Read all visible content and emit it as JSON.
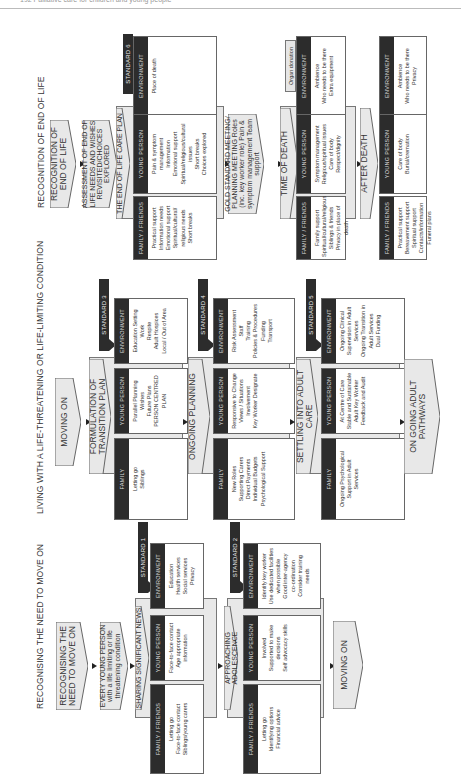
{
  "page": {
    "header_text": "192   Palliative care for children and young people"
  },
  "sections": [
    {
      "title": "RECOGNISING THE NEED TO MOVE ON",
      "intro": [
        {
          "label": "RECOGNISING THE NEED TO MOVE ON"
        },
        {
          "label": "EVERY YOUNG PERSON with a life limiting or life threatening condition"
        }
      ],
      "stages": [
        {
          "label": "SHARING SIGNIFICANT NEWS",
          "standard": "STANDARD 1",
          "family": {
            "heading": "FAMILY / FRIENDS",
            "items": [
              "Letting go",
              "Face-to-face contact",
              "Siblings/young carers"
            ]
          },
          "young_person": {
            "heading": "YOUNG PERSON",
            "items": [
              "Face-to-face contact",
              "Age appropriate",
              "information"
            ]
          },
          "environment": {
            "heading": "ENVIRONMENT",
            "items": [
              "Education",
              "Health services",
              "Social services",
              "Privacy"
            ]
          }
        },
        {
          "label": "APPROACHING ADOLESCENCE",
          "standard": "STANDARD 2",
          "family": {
            "heading": "FAMILY / FRIENDS",
            "items": [
              "Letting go",
              "Identifying options",
              "Financial advice"
            ]
          },
          "young_person": {
            "heading": "YOUNG PERSON",
            "items": [
              "Involved",
              "Supported to make",
              "decisions",
              "Self advocacy skills"
            ]
          },
          "environment": {
            "heading": "ENVIRONMENT",
            "items": [
              "Identify key worker",
              "Use dedicated facilities",
              "when possible",
              "Good inter-agency",
              "co-ordination",
              "Consider training",
              "needs"
            ]
          }
        }
      ],
      "outcome": "MOVING ON"
    },
    {
      "title": "LIVING WITH A LIFE-THREATENING OR LIFE-LIMITING CONDITION",
      "intro": [
        {
          "label": "MOVING ON"
        }
      ],
      "stages": [
        {
          "label": "FORMULATION OF TRANSITION PLAN",
          "standard": "STANDARD 3",
          "family": {
            "heading": "FAMILY",
            "items": [
              "Letting go",
              "Siblings"
            ]
          },
          "young_person": {
            "heading": "YOUNG PERSON",
            "items": [
              "Parallel Planning",
              "Wishes",
              "Future Plans",
              "PERSON CENTRED",
              "PLAN"
            ]
          },
          "environment": {
            "heading": "ENVIRONMENT",
            "items": [
              "Education Setting",
              "Work",
              "Respite",
              "Adult Hospices",
              "Local / Out of Area"
            ]
          }
        },
        {
          "label": "ONGOING PLANNING",
          "standard": "STANDARD 4",
          "family": {
            "heading": "FAMILY",
            "items": [
              "New Roles",
              "Supporting Carers",
              "Direct Payments",
              "Individual Budgets",
              "Psychological Support"
            ]
          },
          "young_person": {
            "heading": "YOUNG PERSON",
            "items": [
              "Responsive to Change",
              "Views / Situations",
              "Involvement",
              "Key Worker Designate"
            ]
          },
          "environment": {
            "heading": "ENVIRONMENT",
            "items": [
              "Risk Assessment",
              "Staff",
              "Training",
              "Policies & Procedures",
              "Funding",
              "Transport"
            ]
          }
        },
        {
          "label": "SETTLING INTO ADULT CARE",
          "standard": "STANDARD 5",
          "family": {
            "heading": "FAMILY",
            "items": [
              "Ongoing Psychological",
              "Support in Adult",
              "Services"
            ]
          },
          "young_person": {
            "heading": "YOUNG PERSON",
            "items": [
              "At Centre of Care",
              "Stable and Sustainable",
              "Adult Key Worker",
              "Feedback and Audit"
            ]
          },
          "environment": {
            "heading": "ENVIRONMENT",
            "items": [
              "Ongoing Clinical",
              "Supervision in Adult",
              "Services",
              "Ongoing Transition in",
              "Adult Services",
              "Dual Funding"
            ]
          }
        }
      ],
      "outcome": "ON GOING ADULT PATHWAYS"
    },
    {
      "title": "RECOGNITION OF END OF LIFE",
      "intro": [
        {
          "label": "RECOGNITION OF END OF LIFE"
        },
        {
          "label": "ASSESSMENT OF END OF LIFE NEEDS AND WISHES REVISITED/CHOICES EXPLORED"
        }
      ],
      "stages": [
        {
          "label": "THE END OF LIFE CARE PLAN",
          "standard": "STANDARD 6",
          "family": {
            "heading": "FAMILY / FRIENDS",
            "items": [
              "Practical support",
              "Information needs",
              "Emotional support",
              "Spiritual/cultural/",
              "religious needs",
              "Short breaks"
            ]
          },
          "young_person": {
            "heading": "YOUNG PERSON",
            "items": [
              "Pain & symptom",
              "management",
              "Information",
              "Emotional support",
              "Spiritual/religious/cultural",
              "issues",
              "Short breaks",
              "Choices explored"
            ]
          },
          "environment": {
            "heading": "ENVIRONMENT",
            "items": [
              "Place of death"
            ]
          }
        },
        {
          "label": "TIME OF DEATH",
          "standard": "Organ donation",
          "family": {
            "heading": "FAMILY / FRIENDS",
            "items": [
              "Family support",
              "Spiritual/cultural/religious",
              "Siblings & friends",
              "Privacy in place of death"
            ]
          },
          "young_person": {
            "heading": "YOUNG PERSON",
            "items": [
              "Symptom management",
              "Religious/spiritual issues",
              "Care of body",
              "Respect/dignity"
            ]
          },
          "environment": {
            "heading": "ENVIRONMENT",
            "items": [
              "Ambience",
              "Who needs to be there",
              "Extra equipment"
            ]
          }
        },
        {
          "label": "AFTER DEATH",
          "family": {
            "heading": "FAMILY / FRIENDS",
            "items": [
              "Practical support",
              "Bereavement support",
              "Spiritual support",
              "Contacts/information",
              "Funeral plans"
            ]
          },
          "young_person": {
            "heading": "YOUNG PERSON",
            "items": [
              "Care of body",
              "Burial/cremation"
            ]
          },
          "environment": {
            "heading": "ENVIRONMENT",
            "items": [
              "Ambience",
              "Who needs to be there",
              "Privacy"
            ]
          }
        }
      ],
      "gold_meeting": "GOLD STANDARD MEETING/ PLANNING MEETING Roles (inc. key worker role) Pain & symptom management Team support"
    }
  ]
}
